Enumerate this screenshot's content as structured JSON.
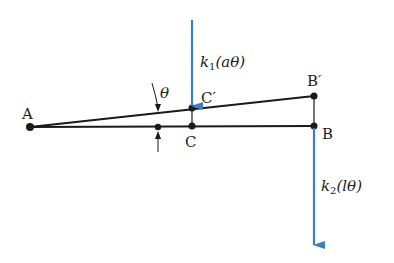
{
  "diagram": {
    "type": "rigid bar with two springs, small rotation",
    "colors": {
      "line": "#1a1a1a",
      "arrow": "#3a7fc4",
      "background": "#ffffff"
    },
    "points": {
      "A": {
        "label": "A",
        "x": 30,
        "y": 127
      },
      "C": {
        "label": "C",
        "x": 192,
        "y": 126
      },
      "C_prime": {
        "label": "C′",
        "x": 192,
        "y": 108
      },
      "B": {
        "label": "B",
        "x": 314,
        "y": 126
      },
      "B_prime": {
        "label": "B′",
        "x": 314,
        "y": 96
      }
    },
    "angle": {
      "label": "θ"
    },
    "forces": [
      {
        "id": "k1",
        "label_k": "k",
        "label_sub": "1",
        "label_arg": "(aθ)",
        "at": "C′",
        "direction": "down"
      },
      {
        "id": "k2",
        "label_k": "k",
        "label_sub": "2",
        "label_arg": "(lθ)",
        "at": "B",
        "direction": "down"
      }
    ]
  }
}
